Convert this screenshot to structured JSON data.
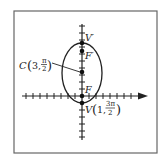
{
  "figure": {
    "frame": {
      "x": 14,
      "y": 11,
      "width": 143,
      "height": 142,
      "stroke": "#555555"
    },
    "axes": {
      "origin": {
        "x": 82,
        "y": 96
      },
      "tick_spacing": 7,
      "x_axis": {
        "from": 22,
        "to": 147,
        "arrow": true
      },
      "y_axis": {
        "from": 24,
        "to": 140
      }
    },
    "ellipse": {
      "cx": 82,
      "cy": 73,
      "rx": 20,
      "ry": 30
    },
    "points": [
      {
        "id": "V-prime",
        "x": 82,
        "y": 43,
        "label": "V′"
      },
      {
        "id": "F-prime",
        "x": 82,
        "y": 51,
        "label": "F′"
      },
      {
        "id": "C",
        "x": 82,
        "y": 72,
        "label": "C"
      },
      {
        "id": "F",
        "x": 82,
        "y": 96,
        "label": "F"
      },
      {
        "id": "V",
        "x": 82,
        "y": 103,
        "label": "V"
      }
    ],
    "labels": {
      "v_prime": "V′",
      "f_prime": "F′",
      "f": "F",
      "center_letter": "C",
      "center_coord_r": "3,",
      "center_coord_num": "π",
      "center_coord_den": "2",
      "vertex_letter": "V",
      "vertex_coord_r": "1,",
      "vertex_coord_num": "3π",
      "vertex_coord_den": "2"
    },
    "ink_color": "#222222"
  }
}
